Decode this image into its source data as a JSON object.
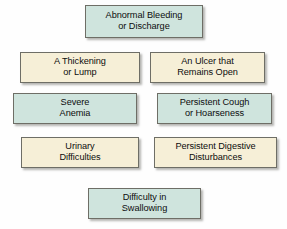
{
  "diagram": {
    "background_color": "#fefefe",
    "box_border_color": "#6e6e66",
    "palette": {
      "teal": "#cfe4dd",
      "cream": "#f6efd7"
    },
    "boxes": [
      {
        "id": "abnormal-bleeding-or-discharge",
        "label": "Abnormal Bleeding\nor Discharge",
        "color": "teal",
        "row": 1,
        "column": "center"
      },
      {
        "id": "a-thickening-or-lump",
        "label": "A Thickening\nor Lump",
        "color": "cream",
        "row": 2,
        "column": "left"
      },
      {
        "id": "an-ulcer-that-remains-open",
        "label": "An Ulcer that\nRemains Open",
        "color": "cream",
        "row": 2,
        "column": "right"
      },
      {
        "id": "severe-anemia",
        "label": "Severe\nAnemia",
        "color": "teal",
        "row": 3,
        "column": "left"
      },
      {
        "id": "persistent-cough-or-hoarseness",
        "label": "Persistent Cough\nor Hoarseness",
        "color": "teal",
        "row": 3,
        "column": "right"
      },
      {
        "id": "urinary-difficulties",
        "label": "Urinary\nDifficulties",
        "color": "cream",
        "row": 4,
        "column": "left"
      },
      {
        "id": "persistent-digestive-disturbances",
        "label": "Persistent Digestive\nDisturbances",
        "color": "cream",
        "row": 4,
        "column": "right"
      },
      {
        "id": "difficulty-in-swallowing",
        "label": "Difficulty in\nSwallowing",
        "color": "teal",
        "row": 5,
        "column": "center"
      }
    ]
  }
}
